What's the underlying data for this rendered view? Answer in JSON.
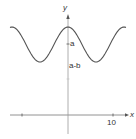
{
  "chart_data": {
    "type": "line",
    "title": "",
    "xlabel": "x",
    "ylabel": "y",
    "x_ticks": [
      -10,
      10
    ],
    "x_tick_labels": [
      "",
      "10"
    ],
    "y_labels": [
      "a",
      "a-b"
    ],
    "series": [
      {
        "name": "y = a - b cos(πx/6)",
        "description": "periodic cosine-shaped curve with minimum a-b at x=0, oscillating about a",
        "x": [
          -13,
          -12,
          -9,
          -6,
          -3,
          0,
          3,
          6,
          9,
          12,
          13
        ],
        "y_relative": [
          "a-b",
          "a-b",
          "a",
          "a+b",
          "a",
          "a-b",
          "a",
          "a+b",
          "a",
          "a-b",
          "a-b"
        ]
      }
    ],
    "xlim": [
      -14,
      14
    ],
    "grid": false,
    "legend": false
  },
  "labels": {
    "x_axis": "x",
    "y_axis": "y",
    "tick_10": "10",
    "level_a": "a",
    "level_a_minus_b": "a-b"
  }
}
